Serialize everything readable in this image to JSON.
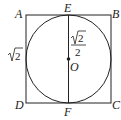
{
  "diagram": {
    "points": {
      "A": "A",
      "B": "B",
      "C": "C",
      "D": "D",
      "E": "E",
      "F": "F",
      "O": "O"
    },
    "side_label": "2",
    "radius_label_num": "2",
    "radius_label_den": "2",
    "colors": {
      "stroke": "#222222",
      "background": "#ffffff"
    }
  }
}
